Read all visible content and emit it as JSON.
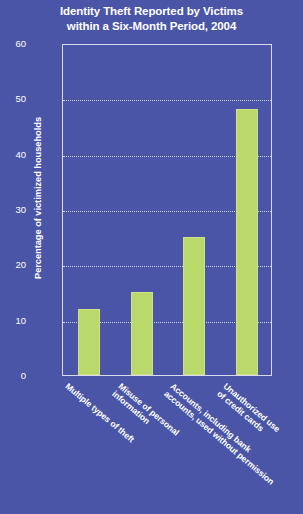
{
  "chart_data": {
    "type": "bar",
    "title": "Identity Theft Reported by Victims within a Six-Month Period, 2004",
    "title_lines": [
      "Identity Theft Reported by Victims",
      "within a Six-Month Period, 2004"
    ],
    "xlabel": "",
    "ylabel": "Percentage of victimized households",
    "ylim": [
      0,
      60
    ],
    "ytick_values": [
      0,
      10,
      20,
      30,
      40,
      50,
      60
    ],
    "ytick_labels": [
      "0",
      "10",
      "20",
      "30",
      "40",
      "50",
      "60"
    ],
    "grid": true,
    "legend": "none",
    "categories": [
      "Multiple types of theft",
      "Misuse of personal information",
      "Accounts, including bank accounts, used without permission",
      "Unauthorized use of credit cards"
    ],
    "category_lines": [
      [
        "Multiple types of theft"
      ],
      [
        "Misuse of personal",
        "information"
      ],
      [
        "Accounts, including bank",
        "accounts, used without permission"
      ],
      [
        "Unauthorized use",
        "of credit cards"
      ]
    ],
    "values": [
      12,
      15,
      25,
      48
    ],
    "colors": {
      "background": "#4a55a8",
      "bar": "#b9d96a",
      "text": "#ffffff",
      "axis": "#d9dcef",
      "gridline": "#cfd4ec"
    }
  }
}
